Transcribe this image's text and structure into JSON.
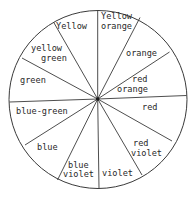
{
  "diagram": {
    "type": "color-wheel",
    "colors": {
      "ink": "#2a2a2a",
      "background": "#ffffff"
    },
    "center": {
      "x": 97.7,
      "y": 99
    },
    "radius": 89,
    "segments": [
      {
        "id": "yellow-orange",
        "lines": [
          "Yellow",
          "orange"
        ]
      },
      {
        "id": "orange",
        "lines": [
          "orange"
        ]
      },
      {
        "id": "red-orange",
        "lines": [
          "red",
          "orange"
        ]
      },
      {
        "id": "red",
        "lines": [
          "red"
        ]
      },
      {
        "id": "red-violet",
        "lines": [
          "red",
          "violet"
        ]
      },
      {
        "id": "violet",
        "lines": [
          "violet"
        ]
      },
      {
        "id": "blue-violet",
        "lines": [
          "blue",
          "violet"
        ]
      },
      {
        "id": "blue",
        "lines": [
          "blue"
        ]
      },
      {
        "id": "blue-green",
        "lines": [
          "blue-green"
        ]
      },
      {
        "id": "green",
        "lines": [
          "green"
        ]
      },
      {
        "id": "yellow-green",
        "lines": [
          "yellow",
          "green"
        ]
      },
      {
        "id": "yellow",
        "lines": [
          "Yellow"
        ]
      }
    ]
  }
}
